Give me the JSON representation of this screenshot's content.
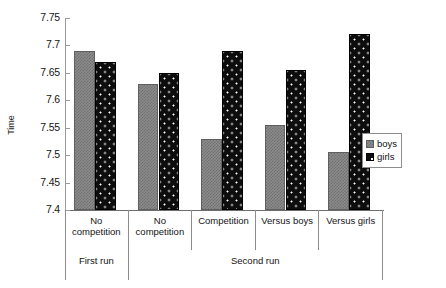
{
  "chart_data": {
    "type": "bar",
    "title": "",
    "xlabel": "",
    "ylabel": "Time",
    "ylim": [
      7.4,
      7.75
    ],
    "yticks": [
      7.4,
      7.45,
      7.5,
      7.55,
      7.6,
      7.65,
      7.7,
      7.75
    ],
    "ytick_labels": [
      "7.4",
      "7.45",
      "7.5",
      "7.55",
      "7.6",
      "7.65",
      "7.7",
      "7.75"
    ],
    "grid": false,
    "legend_position": "right",
    "categories": [
      "No competition",
      "No competition",
      "Competition",
      "Versus boys",
      "Versus girls"
    ],
    "group_labels": [
      "First run",
      "Second run"
    ],
    "group_spans": [
      1,
      4
    ],
    "series": [
      {
        "name": "boys",
        "values": [
          7.69,
          7.63,
          7.53,
          7.555,
          7.505
        ]
      },
      {
        "name": "girls",
        "values": [
          7.67,
          7.65,
          7.69,
          7.655,
          7.72
        ]
      }
    ]
  },
  "legend": {
    "items": [
      {
        "label": "boys",
        "swatch": "boys-swatch-icon"
      },
      {
        "label": "girls",
        "swatch": "girls-swatch-icon"
      }
    ]
  },
  "axis": {
    "y_title": "Time"
  },
  "colors": {
    "boys": "#8c8c8c",
    "girls": "#0d0d0d",
    "axis": "#6d6d6d",
    "grid_line": "#8d8d8d",
    "background": "#ffffff"
  }
}
